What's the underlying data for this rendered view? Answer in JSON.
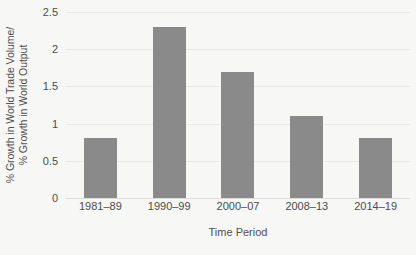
{
  "chart_data": {
    "type": "bar",
    "title": "",
    "subtitle": "",
    "xlabel": "Time Period",
    "ylabel": "% Growth in World Trade Volume/ % Growth in World Output",
    "ylabel_line1": "% Growth in World Trade Volume/",
    "ylabel_line2": "% Growth in World Output",
    "categories": [
      "1981–89",
      "1990–99",
      "2000–07",
      "2008–13",
      "2014–19"
    ],
    "values": [
      0.8,
      2.3,
      1.7,
      1.1,
      0.8
    ],
    "ylim": [
      0,
      2.5
    ],
    "yticks": [
      "0",
      "0.5",
      "1",
      "1.5",
      "2",
      "2.5"
    ],
    "ytick_values": [
      0,
      0.5,
      1,
      1.5,
      2,
      2.5
    ],
    "grid": true,
    "legend": false,
    "legend_position": "none",
    "bar_color": "#8a8a8a",
    "background_color": "#f7f7f5",
    "gridline_color": "#e8e8e6",
    "text_color": "#4c4c4c"
  }
}
